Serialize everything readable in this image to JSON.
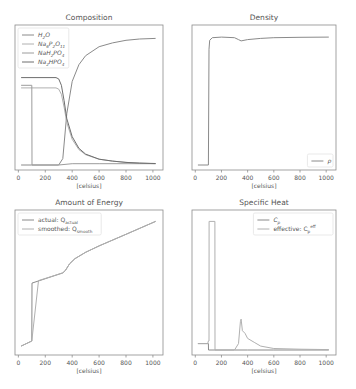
{
  "figure": {
    "width": 356,
    "height": 389,
    "background": "#ffffff"
  },
  "styles": {
    "axis_color": "#8c8c8c",
    "text_color": "#555555",
    "legend_border": "#e0e0e0",
    "line_colors": [
      "#8a8a8a",
      "#b0b0b0",
      "#9c9c9c",
      "#6e6e6e"
    ]
  },
  "chart_data": [
    {
      "id": "composition",
      "type": "line",
      "title": "Composition",
      "xlabel": "[celsius]",
      "ylabel": "",
      "xlim": [
        -25,
        1075
      ],
      "ylim": [
        0,
        1.05
      ],
      "xticks": [
        0,
        200,
        400,
        600,
        800,
        1000
      ],
      "legend_position": "upper left",
      "grid": false,
      "series": [
        {
          "name": "H2O",
          "label_html": "H<sub>2</sub>O",
          "color": "#8a8a8a",
          "x": [
            20,
            100,
            101,
            300,
            330,
            360,
            400,
            450,
            500,
            600,
            700,
            800,
            900,
            1020
          ],
          "y": [
            0.0,
            0.0,
            0.0,
            0.0,
            0.05,
            0.4,
            0.65,
            0.78,
            0.85,
            0.92,
            0.95,
            0.97,
            0.98,
            0.985
          ]
        },
        {
          "name": "Na6P2O11",
          "label_html": "Na<sub>6</sub>P<sub>2</sub>O<sub>11</sub>",
          "color": "#b0b0b0",
          "x": [
            20,
            280,
            300,
            320,
            340,
            360,
            400,
            450,
            500,
            600,
            700,
            800,
            900,
            1020
          ],
          "y": [
            0.6,
            0.6,
            0.59,
            0.55,
            0.45,
            0.33,
            0.2,
            0.12,
            0.08,
            0.045,
            0.03,
            0.02,
            0.015,
            0.01
          ]
        },
        {
          "name": "NaH2PO4",
          "label_html": "NaH<sub>2</sub>PO<sub>4</sub>",
          "color": "#9c9c9c",
          "x": [
            20,
            100,
            101,
            300,
            400,
            600,
            800,
            1020
          ],
          "y": [
            0.62,
            0.62,
            0.0,
            0.0,
            0.01,
            0.01,
            0.01,
            0.01
          ]
        },
        {
          "name": "Na2HPO4",
          "label_html": "Na<sub>2</sub>HPO<sub>4</sub>",
          "color": "#6e6e6e",
          "x": [
            20,
            280,
            300,
            320,
            340,
            360,
            400,
            450,
            500,
            600,
            700,
            800,
            900,
            1020
          ],
          "y": [
            0.68,
            0.68,
            0.67,
            0.62,
            0.5,
            0.36,
            0.22,
            0.13,
            0.085,
            0.045,
            0.03,
            0.02,
            0.015,
            0.012
          ]
        }
      ]
    },
    {
      "id": "density",
      "type": "line",
      "title": "Density",
      "xlabel": "[celsius]",
      "ylabel": "",
      "xlim": [
        -25,
        1075
      ],
      "ylim": [
        0,
        1.05
      ],
      "xticks": [
        0,
        200,
        400,
        600,
        800,
        1000
      ],
      "legend_position": "lower right",
      "grid": false,
      "series": [
        {
          "name": "rho",
          "label_html": "ρ",
          "color": "#8a8a8a",
          "x": [
            20,
            100,
            105,
            110,
            130,
            200,
            300,
            330,
            350,
            400,
            500,
            600,
            800,
            1020
          ],
          "y": [
            0.0,
            0.0,
            0.9,
            0.97,
            0.99,
            0.995,
            0.99,
            0.975,
            0.965,
            0.975,
            0.985,
            0.99,
            0.993,
            0.995
          ]
        }
      ]
    },
    {
      "id": "energy",
      "type": "line",
      "title": "Amount of Energy",
      "xlabel": "[celsius]",
      "ylabel": "",
      "xlim": [
        -25,
        1075
      ],
      "ylim": [
        0,
        1.05
      ],
      "xticks": [
        0,
        200,
        400,
        600,
        800,
        1000
      ],
      "legend_position": "upper left",
      "grid": false,
      "series": [
        {
          "name": "actual: Q_actual",
          "label_html": "actual: Q<sub>actual</sub>",
          "color": "#8a8a8a",
          "x": [
            20,
            100,
            101,
            330,
            350,
            380,
            420,
            500,
            600,
            800,
            1020
          ],
          "y": [
            0.03,
            0.07,
            0.52,
            0.6,
            0.62,
            0.67,
            0.71,
            0.76,
            0.81,
            0.9,
            1.0
          ]
        },
        {
          "name": "smoothed: Q_smooth",
          "label_html": "smoothed: Q<sub>smooth</sub>",
          "color": "#b0b0b0",
          "x": [
            20,
            100,
            150,
            330,
            350,
            380,
            420,
            500,
            600,
            800,
            1020
          ],
          "y": [
            0.03,
            0.07,
            0.54,
            0.6,
            0.62,
            0.67,
            0.71,
            0.76,
            0.81,
            0.9,
            1.0
          ]
        }
      ]
    },
    {
      "id": "specific_heat",
      "type": "line",
      "title": "Specific Heat",
      "xlabel": "[celsius]",
      "ylabel": "",
      "xlim": [
        -25,
        1075
      ],
      "ylim": [
        0,
        1.05
      ],
      "xticks": [
        0,
        200,
        400,
        600,
        800,
        1000
      ],
      "legend_position": "upper right",
      "grid": false,
      "series": [
        {
          "name": "C_p",
          "label_html": "C<sub>p</sub>",
          "color": "#8a8a8a",
          "x": [
            20,
            95,
            100,
            101,
            300,
            400,
            600,
            800,
            1020
          ],
          "y": [
            0.05,
            0.05,
            0.05,
            0.0,
            0.0,
            0.0,
            0.0,
            0.0,
            0.0
          ]
        },
        {
          "name": "effective: C_p^eff",
          "label_html": "effective: C<sub>p</sub><sup>eff</sup>",
          "color": "#b0b0b0",
          "x": [
            20,
            95,
            100,
            105,
            106,
            150,
            151,
            300,
            330,
            345,
            350,
            360,
            380,
            400,
            450,
            500,
            600,
            800,
            1020
          ],
          "y": [
            0.05,
            0.05,
            0.07,
            0.07,
            1.0,
            1.0,
            0.0,
            0.0,
            0.05,
            0.22,
            0.24,
            0.15,
            0.13,
            0.09,
            0.06,
            0.03,
            0.012,
            0.006,
            0.003
          ]
        }
      ]
    }
  ]
}
